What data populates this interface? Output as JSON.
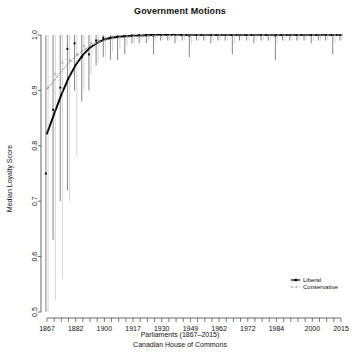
{
  "chart_data": {
    "type": "line",
    "title": "Government Motions",
    "xlabel": "Parliaments (1867–2015)",
    "xlabel_line2": "Canadian House of Commons",
    "ylabel": "Median Loyalty Score",
    "ylim": [
      0.5,
      1.0
    ],
    "yticks": [
      "0.5",
      "0.6",
      "0.7",
      "0.8",
      "0.9",
      "1.0"
    ],
    "ytick_values": [
      0.5,
      0.6,
      0.7,
      0.8,
      0.9,
      1.0
    ],
    "xlim": [
      1,
      42
    ],
    "xticks_labeled": [
      "1867",
      "1882",
      "1900",
      "1917",
      "1930",
      "1949",
      "1962",
      "1972",
      "1984",
      "2000",
      "2015"
    ],
    "xtick_index": [
      1,
      5,
      9,
      13,
      17,
      21,
      25,
      29,
      33,
      38,
      42
    ],
    "n_parliaments": 42,
    "grid": false,
    "legend_position": "bottom-right",
    "legend": [
      "Liberal",
      "Conservative"
    ],
    "colors": {
      "liberal": "#000000",
      "conservative": "#8c8c8c"
    },
    "series": [
      {
        "name": "Liberal",
        "color": "#000000",
        "style": "solid-with-points",
        "values": [
          0.75,
          0.865,
          0.905,
          0.975,
          0.985,
          0.96,
          0.965,
          0.99,
          0.995,
          0.995,
          0.997,
          0.998,
          0.999,
          1.0,
          1.0,
          0.999,
          1.0,
          1.0,
          1.0,
          1.0,
          0.999,
          1.0,
          1.0,
          1.0,
          1.0,
          1.0,
          1.0,
          1.0,
          1.0,
          1.0,
          1.0,
          1.0,
          0.999,
          1.0,
          1.0,
          1.0,
          1.0,
          1.0,
          1.0,
          1.0,
          1.0,
          1.0
        ],
        "err_low": [
          0.5,
          0.63,
          0.7,
          0.72,
          0.9,
          0.88,
          0.9,
          0.945,
          0.96,
          0.955,
          0.955,
          0.965,
          0.985,
          0.985,
          0.985,
          0.965,
          0.99,
          0.99,
          0.985,
          0.99,
          0.96,
          0.99,
          0.99,
          0.985,
          0.99,
          0.99,
          0.965,
          0.99,
          0.99,
          0.985,
          0.99,
          0.99,
          0.955,
          0.99,
          0.99,
          0.99,
          0.99,
          0.985,
          0.99,
          0.99,
          0.965,
          0.99
        ],
        "err_high": [
          1.0,
          1.0,
          1.0,
          1.0,
          1.0,
          1.0,
          1.0,
          1.0,
          1.0,
          1.0,
          1.0,
          1.0,
          1.0,
          1.0,
          1.0,
          1.0,
          1.0,
          1.0,
          1.0,
          1.0,
          1.0,
          1.0,
          1.0,
          1.0,
          1.0,
          1.0,
          1.0,
          1.0,
          1.0,
          1.0,
          1.0,
          1.0,
          1.0,
          1.0,
          1.0,
          1.0,
          1.0,
          1.0,
          1.0,
          1.0,
          1.0,
          1.0
        ],
        "smooth": [
          0.822,
          0.858,
          0.892,
          0.922,
          0.946,
          0.964,
          0.977,
          0.986,
          0.992,
          0.995,
          0.997,
          0.998,
          0.999,
          0.999,
          1.0,
          1.0,
          1.0,
          1.0,
          1.0,
          1.0,
          1.0,
          1.0,
          1.0,
          1.0,
          1.0,
          1.0,
          1.0,
          1.0,
          1.0,
          1.0,
          1.0,
          1.0,
          1.0,
          1.0,
          1.0,
          1.0,
          1.0,
          1.0,
          1.0,
          1.0,
          1.0,
          1.0
        ]
      },
      {
        "name": "Conservative",
        "color": "#8c8c8c",
        "style": "dashed-with-points",
        "values": [
          0.905,
          0.93,
          0.95,
          0.955,
          0.965,
          0.98,
          0.985,
          0.99,
          0.993,
          0.995,
          0.997,
          0.998,
          0.999,
          1.0,
          1.0,
          1.0,
          1.0,
          1.0,
          1.0,
          1.0,
          1.0,
          1.0,
          1.0,
          1.0,
          1.0,
          1.0,
          1.0,
          1.0,
          1.0,
          1.0,
          1.0,
          1.0,
          1.0,
          1.0,
          1.0,
          1.0,
          1.0,
          1.0,
          1.0,
          1.0,
          1.0,
          1.0
        ],
        "err_low": [
          0.5,
          0.52,
          0.56,
          0.7,
          0.78,
          0.9,
          0.93,
          0.95,
          0.96,
          0.97,
          0.975,
          0.98,
          0.985,
          0.99,
          0.99,
          0.985,
          0.99,
          0.99,
          0.99,
          0.99,
          0.985,
          0.99,
          0.99,
          0.99,
          0.99,
          0.99,
          0.985,
          0.99,
          0.99,
          0.99,
          0.99,
          0.99,
          0.985,
          0.99,
          0.99,
          0.99,
          0.99,
          0.99,
          0.99,
          0.99,
          0.985,
          0.99
        ],
        "err_high": [
          1.0,
          1.0,
          1.0,
          1.0,
          1.0,
          1.0,
          1.0,
          1.0,
          1.0,
          1.0,
          1.0,
          1.0,
          1.0,
          1.0,
          1.0,
          1.0,
          1.0,
          1.0,
          1.0,
          1.0,
          1.0,
          1.0,
          1.0,
          1.0,
          1.0,
          1.0,
          1.0,
          1.0,
          1.0,
          1.0,
          1.0,
          1.0,
          1.0,
          1.0,
          1.0,
          1.0,
          1.0,
          1.0,
          1.0,
          1.0,
          1.0,
          1.0
        ],
        "smooth": [
          0.902,
          0.918,
          0.934,
          0.949,
          0.962,
          0.972,
          0.98,
          0.986,
          0.99,
          0.993,
          0.995,
          0.996,
          0.997,
          0.998,
          0.998,
          0.999,
          0.999,
          0.999,
          0.999,
          1.0,
          1.0,
          1.0,
          1.0,
          1.0,
          1.0,
          1.0,
          1.0,
          1.0,
          1.0,
          1.0,
          1.0,
          1.0,
          1.0,
          1.0,
          1.0,
          1.0,
          1.0,
          1.0,
          1.0,
          1.0,
          1.0,
          1.0
        ]
      }
    ]
  }
}
